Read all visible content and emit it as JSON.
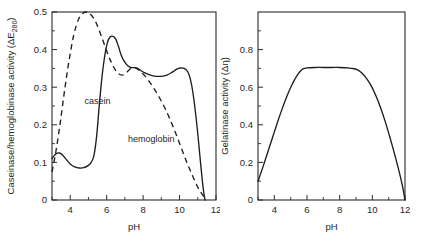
{
  "figure": {
    "background": "#ffffff",
    "ink_color": "#1d1d1d"
  },
  "panels": [
    {
      "id": "left",
      "ylabel_main": "Caseinase/hemoglobinase activity (",
      "ylabel_delta": "ΔE",
      "ylabel_sub": "280",
      "ylabel_close": ")",
      "xlabel": "pH",
      "ytick_labels": [
        "0",
        "0.1",
        "0.2",
        "0.3",
        "0.4",
        "0.5"
      ],
      "xtick_labels": [
        "4",
        "6",
        "8",
        "10",
        "12"
      ],
      "curve_labels": [
        {
          "text": "casein",
          "pH": 5.5,
          "value": 0.255
        },
        {
          "text": "hemoglobin",
          "pH": 8.45,
          "value": 0.155
        }
      ]
    },
    {
      "id": "right",
      "ylabel_main": "Gelatinase activity (",
      "ylabel_delta": "Δη",
      "ylabel_close": ")",
      "xlabel": "pH",
      "ytick_labels": [
        "0",
        "0.2",
        "0.4",
        "0.6",
        "0.8"
      ],
      "xtick_labels": [
        "4",
        "6",
        "8",
        "10",
        "12"
      ]
    }
  ],
  "chart_data": [
    {
      "type": "line",
      "panel": "left",
      "title": "",
      "xlabel": "pH",
      "ylabel": "Caseinase/hemoglobinase activity (ΔE280)",
      "xlim": [
        3,
        12
      ],
      "ylim": [
        0,
        0.5
      ],
      "xticks": [
        4,
        6,
        8,
        10,
        12
      ],
      "xticks_minor": [
        3,
        5,
        7,
        9,
        11
      ],
      "yticks": [
        0,
        0.1,
        0.2,
        0.3,
        0.4,
        0.5
      ],
      "yticks_minor": [
        0.05,
        0.15,
        0.25,
        0.35,
        0.45
      ],
      "grid": false,
      "legend": "inline-annotations",
      "series": [
        {
          "name": "casein",
          "style": "solid",
          "x": [
            3.0,
            3.12,
            3.25,
            3.4,
            3.55,
            3.75,
            4.0,
            4.25,
            4.5,
            4.75,
            5.0,
            5.15,
            5.3,
            5.45,
            5.6,
            5.75,
            5.9,
            6.05,
            6.2,
            6.35,
            6.5,
            6.65,
            6.8,
            6.95,
            7.1,
            7.25,
            7.4,
            7.55,
            7.7,
            7.85,
            8.1,
            8.4,
            8.7,
            9.0,
            9.3,
            9.6,
            9.85,
            10.05,
            10.25,
            10.45,
            10.6,
            10.75,
            10.95,
            11.15,
            11.3,
            11.4
          ],
          "y": [
            0.11,
            0.118,
            0.124,
            0.125,
            0.121,
            0.11,
            0.096,
            0.088,
            0.085,
            0.086,
            0.092,
            0.1,
            0.118,
            0.17,
            0.255,
            0.33,
            0.385,
            0.42,
            0.434,
            0.435,
            0.428,
            0.408,
            0.385,
            0.37,
            0.36,
            0.354,
            0.352,
            0.352,
            0.35,
            0.345,
            0.338,
            0.332,
            0.329,
            0.329,
            0.332,
            0.34,
            0.348,
            0.351,
            0.35,
            0.341,
            0.32,
            0.28,
            0.2,
            0.1,
            0.03,
            0.0
          ]
        },
        {
          "name": "hemoglobin",
          "style": "dashed",
          "x": [
            3.0,
            3.2,
            3.45,
            3.7,
            3.95,
            4.2,
            4.45,
            4.7,
            4.9,
            5.05,
            5.25,
            5.45,
            5.7,
            5.95,
            6.2,
            6.45,
            6.65,
            6.85,
            7.0,
            7.15,
            7.3,
            7.45,
            7.6,
            7.75,
            7.9,
            8.1,
            8.35,
            8.6,
            8.9,
            9.2,
            9.5,
            9.8,
            10.1,
            10.4,
            10.7,
            11.0,
            11.2,
            11.35,
            11.45
          ],
          "y": [
            0.075,
            0.125,
            0.205,
            0.295,
            0.375,
            0.44,
            0.48,
            0.497,
            0.5,
            0.497,
            0.486,
            0.468,
            0.437,
            0.403,
            0.372,
            0.348,
            0.336,
            0.332,
            0.335,
            0.342,
            0.349,
            0.352,
            0.351,
            0.346,
            0.339,
            0.33,
            0.314,
            0.296,
            0.272,
            0.244,
            0.212,
            0.176,
            0.138,
            0.1,
            0.066,
            0.034,
            0.018,
            0.008,
            0.003
          ]
        }
      ]
    },
    {
      "type": "line",
      "panel": "right",
      "title": "",
      "xlabel": "pH",
      "ylabel": "Gelatinase activity (Δη)",
      "xlim": [
        3,
        12
      ],
      "ylim": [
        0,
        1.0
      ],
      "xticks": [
        4,
        6,
        8,
        10,
        12
      ],
      "xticks_minor": [
        3,
        5,
        7,
        9,
        11
      ],
      "yticks": [
        0,
        0.2,
        0.4,
        0.6,
        0.8
      ],
      "yticks_minor": [
        0.1,
        0.3,
        0.5,
        0.7,
        0.9
      ],
      "grid": false,
      "legend": "none",
      "series": [
        {
          "name": "gelatinase",
          "style": "solid",
          "x": [
            3.0,
            3.3,
            3.6,
            3.9,
            4.2,
            4.5,
            4.8,
            5.05,
            5.25,
            5.45,
            5.6,
            5.75,
            6.0,
            6.5,
            7.0,
            7.5,
            8.0,
            8.5,
            8.9,
            9.1,
            9.25,
            9.45,
            9.65,
            9.9,
            10.2,
            10.5,
            10.8,
            11.1,
            11.4,
            11.65,
            11.85,
            12.0
          ],
          "y": [
            0.1,
            0.175,
            0.255,
            0.335,
            0.415,
            0.49,
            0.558,
            0.608,
            0.642,
            0.67,
            0.686,
            0.697,
            0.703,
            0.705,
            0.705,
            0.705,
            0.705,
            0.703,
            0.698,
            0.692,
            0.684,
            0.668,
            0.646,
            0.612,
            0.558,
            0.492,
            0.414,
            0.326,
            0.232,
            0.148,
            0.072,
            0.0
          ]
        }
      ]
    }
  ]
}
